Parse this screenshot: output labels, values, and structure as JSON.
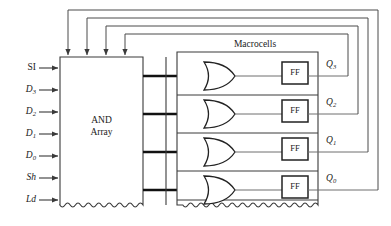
{
  "figure": {
    "kind": "logic-block-diagram"
  },
  "colors": {
    "background": "#ffffff",
    "line": "#3a3a3a",
    "bus": "#111111",
    "text": "#1a1a1a",
    "feedback": "#4a4a4a"
  },
  "and_array": {
    "name": "and-array-block",
    "label_line1": "AND",
    "label_line2": "Array",
    "x": 60,
    "y": 57,
    "width": 83,
    "height": 153,
    "bottom_style": "wavy"
  },
  "macrocells": {
    "name": "macrocells-block",
    "title": "Macrocells",
    "x": 177,
    "y": 52,
    "width": 141,
    "height": 158,
    "bottom_style": "wavy",
    "title_x": 255,
    "title_y": 45
  },
  "inputs": [
    {
      "name": "input-si",
      "text": "SI",
      "italic": false,
      "sub": "",
      "y": 68
    },
    {
      "name": "input-d3",
      "text": "D",
      "italic": true,
      "sub": "3",
      "y": 90
    },
    {
      "name": "input-d2",
      "text": "D",
      "italic": true,
      "sub": "2",
      "y": 112
    },
    {
      "name": "input-d1",
      "text": "D",
      "italic": true,
      "sub": "1",
      "y": 134
    },
    {
      "name": "input-d0",
      "text": "D",
      "italic": true,
      "sub": "0",
      "y": 156
    },
    {
      "name": "input-sh",
      "text": "Sh",
      "italic": true,
      "sub": "",
      "y": 178
    },
    {
      "name": "input-ld",
      "text": "Ld",
      "italic": true,
      "sub": "",
      "y": 200
    }
  ],
  "outputs": [
    {
      "name": "output-q3",
      "text": "Q",
      "sub": "3",
      "y": 66,
      "row": 0
    },
    {
      "name": "output-q2",
      "text": "Q",
      "sub": "2",
      "y": 104,
      "row": 1
    },
    {
      "name": "output-q1",
      "text": "Q",
      "sub": "1",
      "y": 142,
      "row": 2
    },
    {
      "name": "output-q0",
      "text": "Q",
      "sub": "0",
      "y": 180,
      "row": 3
    }
  ],
  "macrocell_rows": [
    {
      "name": "macrocell-row-3",
      "center_y": 76,
      "or_gate": "or-gate-3",
      "ff": "flipflop-3",
      "ff_label": "FF"
    },
    {
      "name": "macrocell-row-2",
      "center_y": 114,
      "or_gate": "or-gate-2",
      "ff": "flipflop-2",
      "ff_label": "FF"
    },
    {
      "name": "macrocell-row-1",
      "center_y": 152,
      "or_gate": "or-gate-1",
      "ff": "flipflop-1",
      "ff_label": "FF"
    },
    {
      "name": "macrocell-row-0",
      "center_y": 190,
      "or_gate": "or-gate-0",
      "ff": "flipflop-0",
      "ff_label": "FF"
    }
  ],
  "feedback_paths": [
    {
      "name": "feedback-q3",
      "from_row": 0,
      "turn_x": 348,
      "top_y": 34,
      "arrow_x": 125
    },
    {
      "name": "feedback-q2",
      "from_row": 1,
      "turn_x": 358,
      "top_y": 26,
      "arrow_x": 106
    },
    {
      "name": "feedback-q1",
      "from_row": 2,
      "turn_x": 368,
      "top_y": 18,
      "arrow_x": 87
    },
    {
      "name": "feedback-q0",
      "from_row": 3,
      "turn_x": 378,
      "top_y": 10,
      "arrow_x": 68
    }
  ]
}
